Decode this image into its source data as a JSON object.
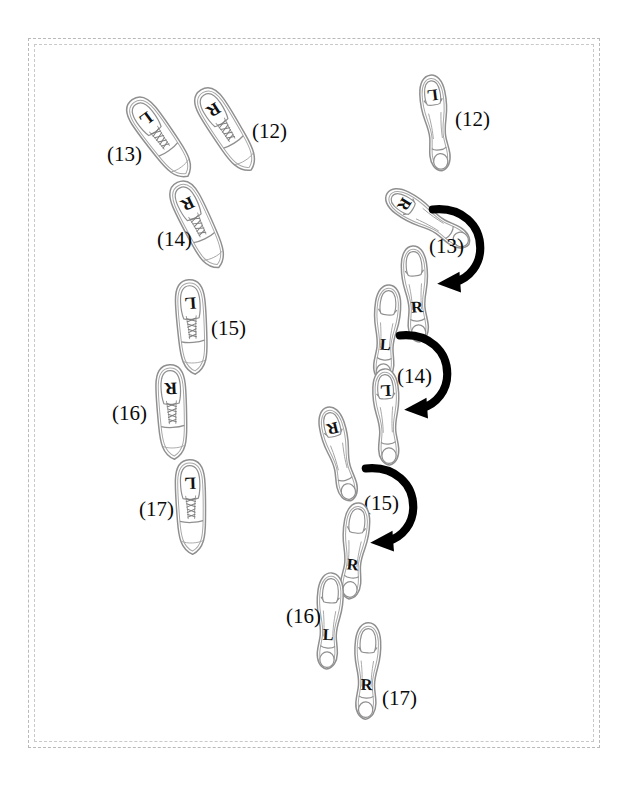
{
  "figure": {
    "background_color": "#ffffff",
    "outline_color": "#8a8a8a",
    "ink_color": "#0a0a0a",
    "frame": {
      "style": "double-dashed-rectangle",
      "color": "#bdbdbd"
    }
  },
  "panels": [
    {
      "id": "left",
      "shoe_type": "oxford-dress-shoe",
      "view": "top-down",
      "has_arrows": false,
      "steps": [
        {
          "number": "(12)",
          "foot": "R",
          "label": "(12)"
        },
        {
          "number": "(13)",
          "foot": "L",
          "label": "(13)"
        },
        {
          "number": "(14)",
          "foot": "R",
          "label": "(14)"
        },
        {
          "number": "(15)",
          "foot": "L",
          "label": "(15)"
        },
        {
          "number": "(16)",
          "foot": "R",
          "label": "(16)"
        },
        {
          "number": "(17)",
          "foot": "L",
          "label": "(17)"
        }
      ]
    },
    {
      "id": "right",
      "shoe_type": "high-heel-pump",
      "view": "top-down",
      "has_arrows": true,
      "steps": [
        {
          "number": "(12)",
          "foot": "L",
          "label": "(12)"
        },
        {
          "number": "(13)",
          "foot": "R",
          "label": "(13)"
        },
        {
          "number": "(13b)",
          "foot": "R",
          "label": ""
        },
        {
          "number": "(14)",
          "foot": "L",
          "label": "(14)"
        },
        {
          "number": "(14b)",
          "foot": "L",
          "label": ""
        },
        {
          "number": "(15)",
          "foot": "R",
          "label": "(15)"
        },
        {
          "number": "(15b)",
          "foot": "R",
          "label": ""
        },
        {
          "number": "(16)",
          "foot": "L",
          "label": "(16)"
        },
        {
          "number": "(17)",
          "foot": "R",
          "label": "(17)"
        }
      ],
      "arrows": [
        {
          "for_step": "(13)",
          "direction": "clockwise-to-left",
          "style": "thick-curved"
        },
        {
          "for_step": "(14)",
          "direction": "clockwise-to-left",
          "style": "thick-curved"
        },
        {
          "for_step": "(15)",
          "direction": "clockwise-to-left",
          "style": "thick-curved"
        }
      ]
    }
  ],
  "left_shoes": [
    {
      "name": "left-shoe-12",
      "foot": "R"
    },
    {
      "name": "left-shoe-13",
      "foot": "L"
    },
    {
      "name": "left-shoe-14",
      "foot": "R"
    },
    {
      "name": "left-shoe-15",
      "foot": "L"
    },
    {
      "name": "left-shoe-16",
      "foot": "R"
    },
    {
      "name": "left-shoe-17",
      "foot": "L"
    }
  ],
  "right_shoes": [
    {
      "name": "right-shoe-12",
      "foot": "L"
    },
    {
      "name": "right-shoe-13",
      "foot": "R"
    },
    {
      "name": "right-shoe-13b",
      "foot": "R"
    },
    {
      "name": "right-shoe-14",
      "foot": "L"
    },
    {
      "name": "right-shoe-14b",
      "foot": "L"
    },
    {
      "name": "right-shoe-15",
      "foot": "R"
    },
    {
      "name": "right-shoe-15b",
      "foot": "R"
    },
    {
      "name": "right-shoe-16",
      "foot": "L"
    },
    {
      "name": "right-shoe-17",
      "foot": "R"
    }
  ],
  "labels": {
    "left": {
      "l12": "(12)",
      "l13": "(13)",
      "l14": "(14)",
      "l15": "(15)",
      "l16": "(16)",
      "l17": "(17)"
    },
    "right": {
      "r12": "(12)",
      "r13": "(13)",
      "r14": "(14)",
      "r15": "(15)",
      "r16": "(16)",
      "r17": "(17)"
    }
  },
  "foot_marks": {
    "l12": "R",
    "l13": "L",
    "l14": "R",
    "l15": "L",
    "l16": "R",
    "l17": "L",
    "r12": "L",
    "r13": "R",
    "r13b": "R",
    "r14": "L",
    "r14b": "L",
    "r15": "R",
    "r15b": "R",
    "r16": "L",
    "r17": "R"
  }
}
